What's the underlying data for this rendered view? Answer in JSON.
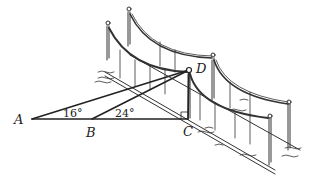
{
  "diagram": {
    "type": "geometry-figure",
    "points": {
      "A": "A",
      "B": "B",
      "C": "C",
      "D": "D"
    },
    "angles": {
      "at_A": "16°",
      "at_B": "24°"
    },
    "colors": {
      "line": "#222222",
      "background": "#ffffff"
    }
  }
}
